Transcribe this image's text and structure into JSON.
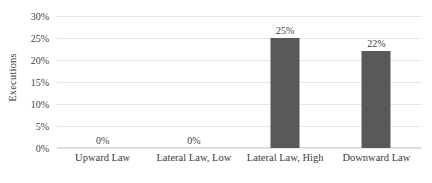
{
  "chart_data": {
    "type": "bar",
    "title": "",
    "xlabel": "",
    "ylabel": "Executions",
    "categories": [
      "Upward Law",
      "Lateral Law, Low",
      "Lateral Law, High",
      "Downward Law"
    ],
    "values": [
      0,
      0,
      25,
      22
    ],
    "value_labels": [
      "0%",
      "0%",
      "25%",
      "22%"
    ],
    "ylim": [
      0,
      30
    ],
    "ytick_values": [
      0,
      5,
      10,
      15,
      20,
      25,
      30
    ],
    "ytick_labels": [
      "0%",
      "5%",
      "10%",
      "15%",
      "20%",
      "25%",
      "30%"
    ],
    "grid": true,
    "legend": false,
    "bar_color": "#595959",
    "gridline_color": "#e6e6e6",
    "background_color": "#ffffff"
  }
}
